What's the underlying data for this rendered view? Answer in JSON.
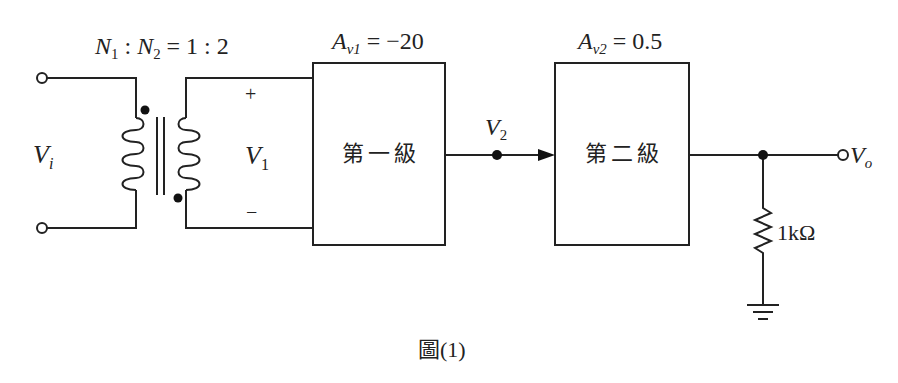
{
  "diagram": {
    "type": "circuit-block-diagram",
    "transformer": {
      "ratio_label": {
        "n1": "N",
        "n1_sub": "1",
        "sep": " : ",
        "n2": "N",
        "n2_sub": "2",
        "eq": " = 1 : 2"
      }
    },
    "input": {
      "label": "V",
      "sub": "i"
    },
    "secondary": {
      "label": "V",
      "sub": "1",
      "plus": "+",
      "minus": "−"
    },
    "stage1": {
      "name": "第一級",
      "gain_label": "A",
      "gain_sub": "v1",
      "gain_value": " = −20"
    },
    "node_v2": {
      "label": "V",
      "sub": "2"
    },
    "stage2": {
      "name": "第二級",
      "gain_label": "A",
      "gain_sub": "v2",
      "gain_value": " = 0.5"
    },
    "load": {
      "label": "1kΩ"
    },
    "output": {
      "label": "V",
      "sub": "o"
    },
    "caption": "圖(1)"
  }
}
